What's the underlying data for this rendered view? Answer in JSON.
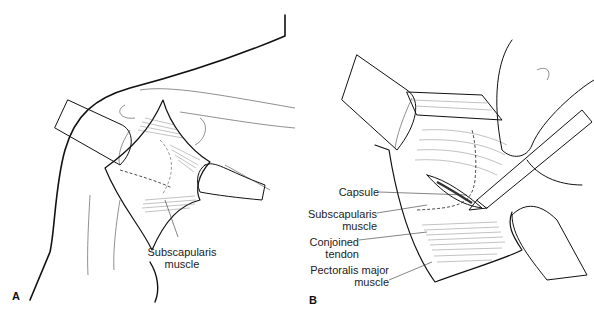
{
  "figure": {
    "panels": [
      {
        "id": "A",
        "letter": "A",
        "labels": [
          {
            "text_line1": "Subscapularis",
            "text_line2": "muscle"
          }
        ]
      },
      {
        "id": "B",
        "letter": "B",
        "labels": [
          {
            "text_line1": "Capsule",
            "text_line2": ""
          },
          {
            "text_line1": "Subscapularis",
            "text_line2": "muscle"
          },
          {
            "text_line1": "Conjoined",
            "text_line2": "tendon"
          },
          {
            "text_line1": "Pectoralis major",
            "text_line2": "muscle"
          }
        ]
      }
    ],
    "colors": {
      "ink": "#111111",
      "background": "#ffffff"
    }
  }
}
